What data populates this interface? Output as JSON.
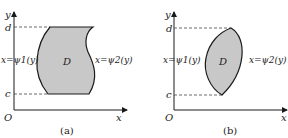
{
  "figure": {
    "colors": {
      "fill": "#c8c8c8",
      "stroke": "#1a1a1a",
      "text": "#222222",
      "background": "#ffffff"
    },
    "panels": [
      {
        "caption": "(a)",
        "axis_y_label": "y",
        "axis_x_label": "x",
        "origin_label": "O",
        "tick_top_label": "d",
        "tick_bottom_label": "c",
        "region_label": "D",
        "left_curve_label": "x=ψ1(y)",
        "right_curve_label": "x=ψ2(y)"
      },
      {
        "caption": "(b)",
        "axis_y_label": "y",
        "axis_x_label": "x",
        "origin_label": "O",
        "tick_top_label": "d",
        "tick_bottom_label": "c",
        "region_label": "D",
        "left_curve_label": "x=ψ1(y)",
        "right_curve_label": "x=ψ2(y)"
      }
    ]
  }
}
